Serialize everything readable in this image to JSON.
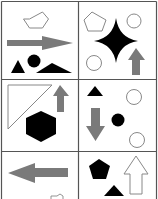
{
  "puzzle": {
    "colors": {
      "background": "#ffffff",
      "grid_line": "#555555",
      "outline_shape": "#888888",
      "black_shape": "#000000",
      "gray_arrow": "#7a7a7a"
    },
    "grid": {
      "rows": 3,
      "columns": 2,
      "visible_rows_note": "third row cropped at bottom"
    },
    "cells": [
      {
        "row": 1,
        "col": 1,
        "shapes": [
          "outlined-hexagon",
          "gray-arrow-right",
          "black-triangle",
          "black-circle",
          "black-wide-triangle"
        ]
      },
      {
        "row": 1,
        "col": 2,
        "shapes": [
          "outlined-pentagon",
          "outlined-circle",
          "black-four-point-star",
          "outlined-circle",
          "gray-arrow-up"
        ]
      },
      {
        "row": 2,
        "col": 1,
        "shapes": [
          "outlined-right-triangle",
          "gray-arrow-up",
          "black-hexagon"
        ]
      },
      {
        "row": 2,
        "col": 2,
        "shapes": [
          "black-triangle",
          "outlined-circle",
          "gray-arrow-down",
          "black-circle",
          "outlined-circle"
        ]
      },
      {
        "row": 3,
        "col": 1,
        "shapes": [
          "gray-arrow-left",
          "outlined-hexagon-partial"
        ]
      },
      {
        "row": 3,
        "col": 2,
        "shapes": [
          "black-pentagon",
          "outlined-arrow-up",
          "black-triangle"
        ]
      }
    ]
  }
}
